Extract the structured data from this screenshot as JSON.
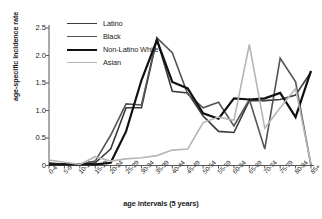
{
  "chart_data": {
    "type": "line",
    "title": "",
    "xlabel": "age intervals (5 years)",
    "ylabel": "age-specific incidence rate",
    "grid": false,
    "legend_position": "top-left",
    "ylim": [
      0,
      2.5
    ],
    "yticks": [
      "0",
      "0.5",
      "1.0",
      "1.5",
      "2.0",
      "2.5"
    ],
    "ytick_values": [
      0,
      0.5,
      1.0,
      1.5,
      2.0,
      2.5
    ],
    "categories": [
      "0-4",
      "5-9",
      "10-14",
      "15-19",
      "20-24",
      "25-29",
      "30-34",
      "35-39",
      "40-44",
      "45-49",
      "50-54",
      "55-59",
      "60-64",
      "65-69",
      "70-74",
      "75-79",
      "80-84",
      "85+"
    ],
    "series": [
      {
        "name": "Latino",
        "color": "#3a3a3a",
        "width": 1.6,
        "values": [
          0.02,
          0.03,
          0.02,
          0.05,
          0.3,
          1.05,
          1.05,
          2.3,
          1.35,
          1.32,
          0.9,
          0.62,
          0.6,
          1.18,
          1.18,
          1.2,
          1.28,
          1.7
        ]
      },
      {
        "name": "Black",
        "color": "#555555",
        "width": 1.6,
        "values": [
          0.05,
          0.02,
          0.02,
          0.08,
          0.55,
          1.12,
          1.1,
          2.32,
          2.05,
          1.3,
          1.05,
          1.15,
          0.72,
          1.2,
          0.3,
          1.95,
          1.52,
          0.0
        ]
      },
      {
        "name": "Non-Latino White",
        "color": "#111111",
        "width": 2.2,
        "values": [
          0.02,
          0.02,
          0.02,
          0.02,
          0.05,
          0.62,
          1.55,
          2.28,
          1.52,
          1.4,
          0.95,
          0.85,
          1.22,
          1.2,
          1.22,
          1.32,
          0.88,
          1.72
        ]
      },
      {
        "name": "Asian",
        "color": "#b6b6b6",
        "width": 1.6,
        "values": [
          0.1,
          0.06,
          0.02,
          0.16,
          0.08,
          0.12,
          0.14,
          0.18,
          0.28,
          0.3,
          0.78,
          0.88,
          0.82,
          2.2,
          0.68,
          1.05,
          1.4,
          0.02
        ]
      }
    ]
  },
  "legend": {
    "items": [
      {
        "label": "Latino"
      },
      {
        "label": "Black"
      },
      {
        "label": "Non-Latino White"
      },
      {
        "label": "Asian"
      }
    ]
  }
}
